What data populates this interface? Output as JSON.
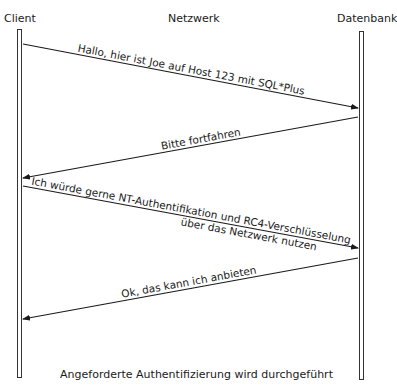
{
  "participants": {
    "client": "Client",
    "network": "Netzwerk",
    "database": "Datenbank"
  },
  "messages": [
    {
      "from": "Client",
      "to": "Datenbank",
      "label": "Hallo, hier ist Joe auf Host 123 mit SQL*Plus"
    },
    {
      "from": "Datenbank",
      "to": "Client",
      "label": "Bitte fortfahren"
    },
    {
      "from": "Client",
      "to": "Datenbank",
      "label_line1": "Ich würde gerne NT-Authentifikation und RC4-Verschlüsselung",
      "label_line2": "über das Netzwerk nutzen"
    },
    {
      "from": "Datenbank",
      "to": "Client",
      "label": "Ok, das kann ich anbieten"
    }
  ],
  "footer": "Angeforderte Authentifizierung wird durchgeführt",
  "colors": {
    "line": "#1a1a1a",
    "background": "#ffffff"
  }
}
